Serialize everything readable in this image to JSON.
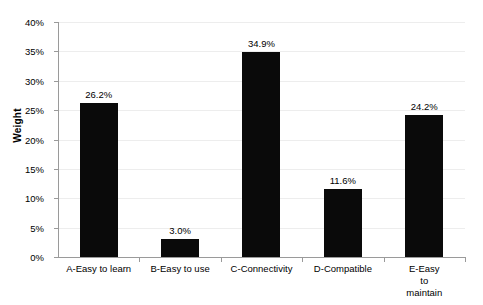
{
  "chart_data": {
    "type": "bar",
    "title": "",
    "subtitle": "",
    "xlabel": "",
    "ylabel": "Weight",
    "categories": [
      "A-Easy to learn",
      "B-Easy to use",
      "C-Connectivity",
      "D-Compatible",
      "E-Easy to\nmaintain"
    ],
    "values": [
      26.2,
      3.0,
      34.9,
      11.6,
      24.2
    ],
    "data_labels": [
      "26.2%",
      "3.0%",
      "34.9%",
      "11.6%",
      "24.2%"
    ],
    "ylim": [
      0,
      40
    ],
    "ytick_values": [
      0,
      5,
      10,
      15,
      20,
      25,
      30,
      35,
      40
    ],
    "ytick_labels": [
      "0%",
      "5%",
      "10%",
      "15%",
      "20%",
      "25%",
      "30%",
      "35%",
      "40%"
    ],
    "grid": true,
    "legend": false,
    "legend_position": "none",
    "units": "percent"
  },
  "style": {
    "bar_color": "#0a0a0a",
    "gridline_color": "#ededed",
    "axis_color": "#9a9a9a",
    "background_color": "#ffffff",
    "text_color": "#000000"
  }
}
